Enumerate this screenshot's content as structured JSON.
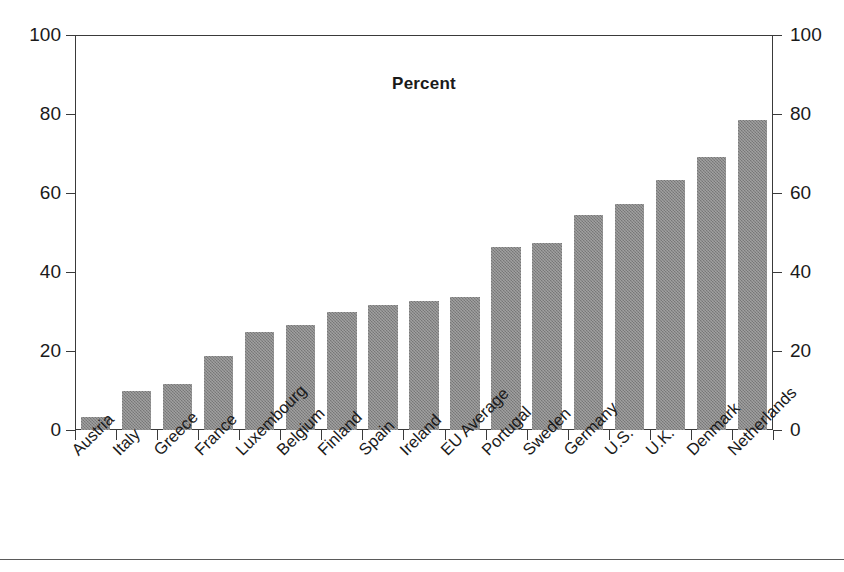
{
  "chart_data": {
    "type": "bar",
    "title": "Percent",
    "xlabel": "",
    "ylabel": "",
    "ylim": [
      0,
      100
    ],
    "yticks": [
      0,
      20,
      40,
      60,
      80,
      100
    ],
    "ytick_labels": [
      "0",
      "20",
      "40",
      "60",
      "80",
      "100"
    ],
    "grid": false,
    "legend": false,
    "dual_y_axis": true,
    "categories": [
      "Austria",
      "Italy",
      "Greece",
      "France",
      "Luxembourg",
      "Belgium",
      "Finland",
      "Spain",
      "Ireland",
      "EU Average",
      "Portugal",
      "Sweden",
      "Germany",
      "U.S.",
      "U.K.",
      "Denmark",
      "Netherlands"
    ],
    "values": [
      3.2,
      9.8,
      11.7,
      18.7,
      24.8,
      26.6,
      29.8,
      31.7,
      32.7,
      33.7,
      46.4,
      47.3,
      54.4,
      57.3,
      63.4,
      69.2,
      78.5
    ],
    "bar_color": "#858585",
    "bar_edge_color": "#4a4a4a",
    "axis_color": "#3a3a3a",
    "text_color": "#1a1a1a",
    "background_color": "#ffffff"
  }
}
